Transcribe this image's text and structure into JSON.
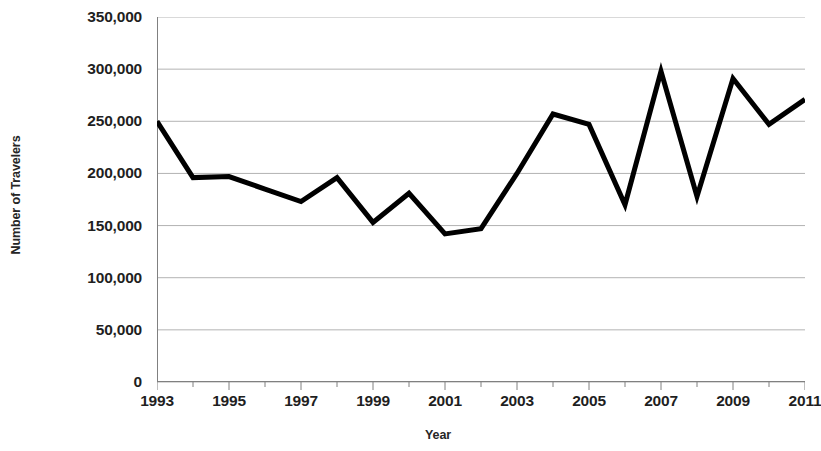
{
  "chart_data": {
    "type": "line",
    "title": "",
    "xlabel": "Year",
    "ylabel": "Number of Travelers",
    "x": [
      1993,
      1994,
      1995,
      1996,
      1997,
      1998,
      1999,
      2000,
      2001,
      2002,
      2003,
      2004,
      2005,
      2006,
      2007,
      2008,
      2009,
      2010,
      2011
    ],
    "values": [
      250000,
      196000,
      197000,
      185000,
      173000,
      196000,
      153000,
      181000,
      142000,
      147000,
      200000,
      257000,
      247000,
      170000,
      298000,
      178000,
      291000,
      247000,
      271000
    ],
    "series": [
      {
        "name": "Number of Travelers",
        "values": [
          250000,
          196000,
          197000,
          185000,
          173000,
          196000,
          153000,
          181000,
          142000,
          147000,
          200000,
          257000,
          247000,
          170000,
          298000,
          178000,
          291000,
          247000,
          271000
        ]
      }
    ],
    "xlim": [
      1993,
      2011
    ],
    "ylim": [
      0,
      350000
    ],
    "y_ticks": [
      0,
      50000,
      100000,
      150000,
      200000,
      250000,
      300000,
      350000
    ],
    "y_tick_labels": [
      "0",
      "50,000",
      "100,000",
      "150,000",
      "200,000",
      "250,000",
      "300,000",
      "350,000"
    ],
    "x_tick_labels": [
      "1993",
      "1995",
      "1997",
      "1999",
      "2001",
      "2003",
      "2005",
      "2007",
      "2009",
      "2011"
    ],
    "x_tick_values": [
      1993,
      1995,
      1997,
      1999,
      2001,
      2003,
      2005,
      2007,
      2009,
      2011
    ],
    "x_minor_ticks": [
      1994,
      1996,
      1998,
      2000,
      2002,
      2004,
      2006,
      2008,
      2010
    ],
    "grid": true,
    "grid_axis": "y",
    "legend": false,
    "legend_position": "none",
    "line_color": "#000000",
    "line_width": 5,
    "grid_color": "#b3b3b3",
    "axis_color": "#808080",
    "background_color": "#ffffff"
  }
}
